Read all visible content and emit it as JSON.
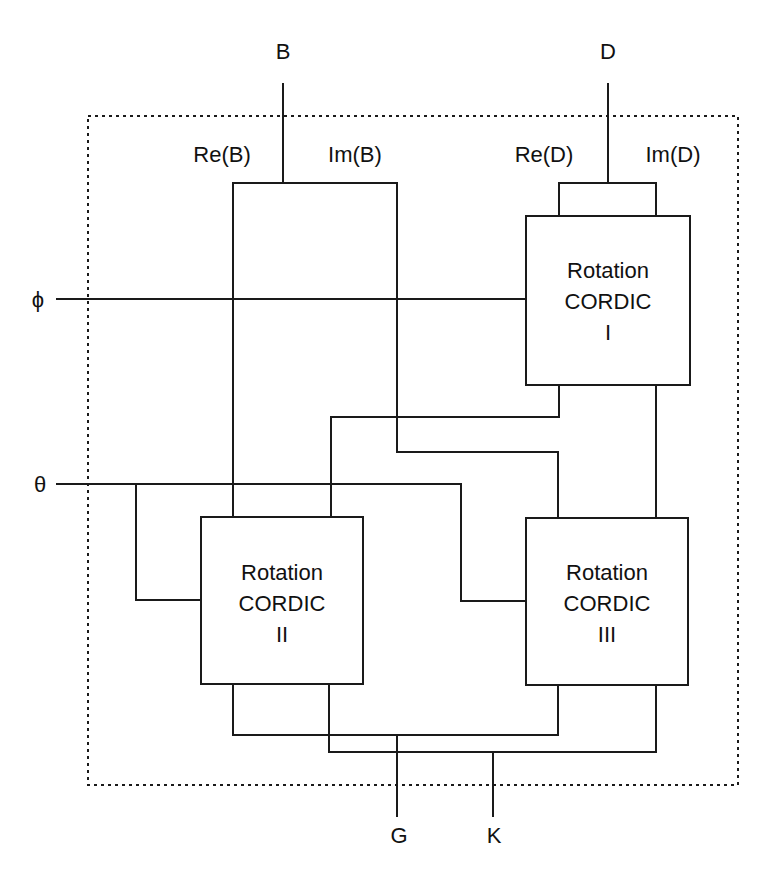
{
  "diagram": {
    "inputs": {
      "B": "B",
      "D": "D",
      "phi": "ϕ",
      "theta": "θ"
    },
    "outputs": {
      "G": "G",
      "K": "K"
    },
    "ports": {
      "re_b": "Re(B)",
      "im_b": "Im(B)",
      "re_d": "Re(D)",
      "im_d": "Im(D)"
    },
    "blocks": [
      {
        "id": "I",
        "line1": "Rotation",
        "line2": "CORDIC",
        "line3": "I"
      },
      {
        "id": "II",
        "line1": "Rotation",
        "line2": "CORDIC",
        "line3": "II"
      },
      {
        "id": "III",
        "line1": "Rotation",
        "line2": "CORDIC",
        "line3": "III"
      }
    ],
    "colors": {
      "line": "#1a1a1a",
      "background": "#ffffff"
    }
  }
}
